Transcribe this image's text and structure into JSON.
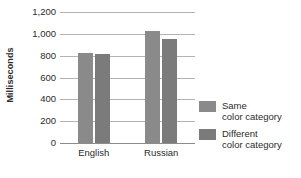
{
  "chart_data": {
    "type": "bar",
    "title": "",
    "subtitle": "",
    "xlabel": "",
    "ylabel": "Milliseconds",
    "categories": [
      "English",
      "Russian"
    ],
    "series": [
      {
        "name": "Same color category",
        "values": [
          820,
          1030
        ],
        "color": "#8a8a8a"
      },
      {
        "name": "Different color category",
        "values": [
          815,
          955
        ],
        "color": "#7b7b7b"
      }
    ],
    "ylim": [
      0,
      1200
    ],
    "ytick_step": 200,
    "ytick_labels": [
      "1,200",
      "1,000",
      "800",
      "600",
      "400",
      "200",
      "0"
    ],
    "ytick_values": [
      1200,
      1000,
      800,
      600,
      400,
      200,
      0
    ],
    "grid": true,
    "grid_orientation": "horizontal",
    "legend_position": "right",
    "legend": [
      {
        "line1": "Same",
        "line2": "color category",
        "swatch": "#8a8a8a"
      },
      {
        "line1": "Different",
        "line2": "color category",
        "swatch": "#7b7b7b"
      }
    ]
  }
}
